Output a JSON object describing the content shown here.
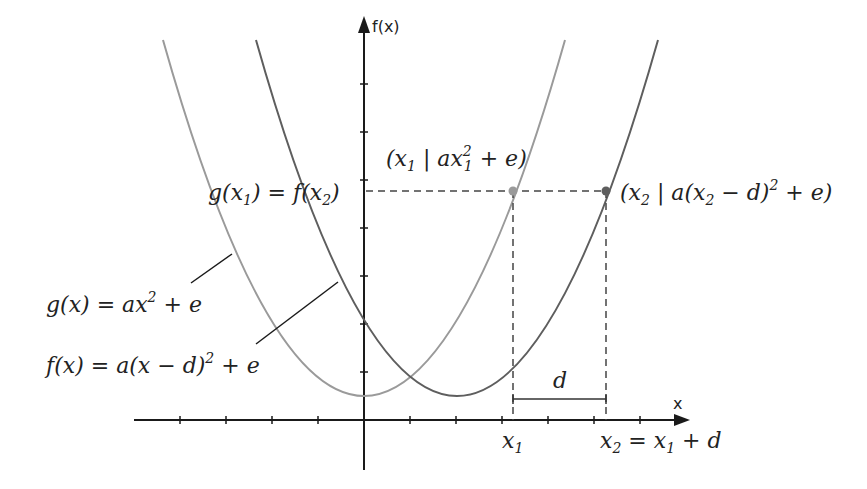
{
  "axes": {
    "y_label": "f(x)",
    "x_label": "x"
  },
  "curves": {
    "g": {
      "label_lhs": "g(x) = ax",
      "label_exp": "2",
      "label_rhs": " + e",
      "color": "#9a9a9a"
    },
    "f": {
      "label_lhs": "f(x) = a(x − d)",
      "label_exp": "2",
      "label_rhs": " + e",
      "color": "#5e5e5e"
    }
  },
  "annotations": {
    "equality_label": "g(x",
    "equality_sub1": "1",
    "equality_mid": ") = f(x",
    "equality_sub2": "2",
    "equality_end": ")",
    "point1": {
      "open": "(x",
      "sub": "1",
      "mid": " | ax",
      "sup": "2",
      "sub2": "1",
      "close": " + e)",
      "color": "#9a9a9a"
    },
    "point2": {
      "open": "(x",
      "sub": "2",
      "mid": " | a(x",
      "sub2": "2",
      "mid2": " − d)",
      "sup": "2",
      "close": " + e)",
      "color": "#5e5e5e"
    },
    "d_label": "d",
    "x1_label": "x",
    "x1_sub": "1",
    "x2_label": "x",
    "x2_sub": "2",
    "x2_rhs": " = x",
    "x2_rhs_sub": "1",
    "x2_rhs_end": " + d"
  }
}
